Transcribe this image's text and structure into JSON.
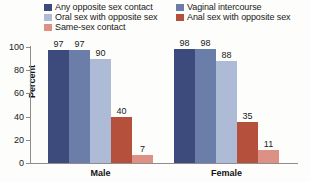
{
  "chart_data": {
    "type": "bar",
    "title": "",
    "xlabel": "",
    "ylabel": "Percent",
    "ylim": [
      0,
      100
    ],
    "yticks": [
      0,
      20,
      40,
      60,
      80,
      100
    ],
    "grid": false,
    "legend_position": "top",
    "categories": [
      "Male",
      "Female"
    ],
    "series": [
      {
        "name": "Any opposite sex contact",
        "color": "#3c4b7c",
        "values": [
          97,
          98
        ]
      },
      {
        "name": "Vaginal intercourse",
        "color": "#6b7da9",
        "values": [
          97,
          98
        ]
      },
      {
        "name": "Oral sex with opposite sex",
        "color": "#adbbd7",
        "values": [
          90,
          88
        ]
      },
      {
        "name": "Anal sex with opposite sex",
        "color": "#b4503c",
        "values": [
          40,
          35
        ]
      },
      {
        "name": "Same-sex contact",
        "color": "#dd9184",
        "values": [
          7,
          11
        ]
      }
    ]
  },
  "legend": {
    "items": [
      {
        "label": "Any opposite sex contact",
        "color": "#3c4b7c"
      },
      {
        "label": "Oral sex with opposite sex",
        "color": "#adbbd7"
      },
      {
        "label": "Same-sex contact",
        "color": "#dd9184"
      },
      {
        "label": "Vaginal intercourse",
        "color": "#6b7da9"
      },
      {
        "label": "Anal sex with opposite sex",
        "color": "#b4503c"
      }
    ]
  },
  "axis": {
    "y_title": "Percent",
    "y_ticks": [
      "100",
      "80",
      "60",
      "40",
      "20",
      "0"
    ]
  },
  "groups": [
    {
      "label": "Male",
      "values": [
        "97",
        "97",
        "90",
        "40",
        "7"
      ]
    },
    {
      "label": "Female",
      "values": [
        "98",
        "98",
        "88",
        "35",
        "11"
      ]
    }
  ]
}
